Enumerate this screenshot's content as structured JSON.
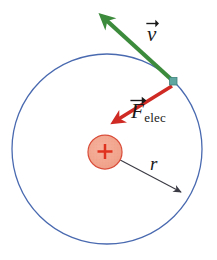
{
  "figure": {
    "background_color": "#ffffff",
    "width": 217,
    "height": 260
  },
  "orbit": {
    "name": "electron-orbit-circle",
    "center_x": 107,
    "center_y": 149,
    "radius": 95,
    "stroke_color": "#4a6ab0",
    "stroke_width": 1.3,
    "fill": "none"
  },
  "nucleus": {
    "name": "nucleus",
    "center_x": 105,
    "center_y": 152,
    "radius": 17,
    "fill_color": "#f2a58f",
    "stroke_color": "#d94d3a",
    "charge_symbol": "+",
    "charge_color": "#e0331f"
  },
  "electron": {
    "name": "electron-marker",
    "x": 173,
    "y": 81,
    "size": 7,
    "fill_color": "#5fa6a0",
    "stroke_color": "#3f837e"
  },
  "vectors": [
    {
      "id": "velocity",
      "label": "v",
      "label_x": 147,
      "label_y": 24,
      "has_overbar_arrow": true,
      "color": "#3c8a3b",
      "from_x": 173,
      "from_y": 81,
      "to_x": 99,
      "to_y": 13,
      "stroke_width": 4.2
    },
    {
      "id": "force-electric",
      "label": "F",
      "subscript": "elec",
      "label_x": 131,
      "label_y": 101,
      "has_overbar_arrow": true,
      "color": "#cf2b24",
      "from_x": 172,
      "from_y": 86,
      "to_x": 112,
      "to_y": 123,
      "stroke_width": 3.6
    }
  ],
  "radius_annotation": {
    "id": "radius",
    "label": "r",
    "label_x": 150,
    "label_y": 154,
    "color": "#3a3a44",
    "from_x": 105,
    "from_y": 152,
    "to_x": 184,
    "to_y": 194,
    "stroke_width": 1.1
  }
}
